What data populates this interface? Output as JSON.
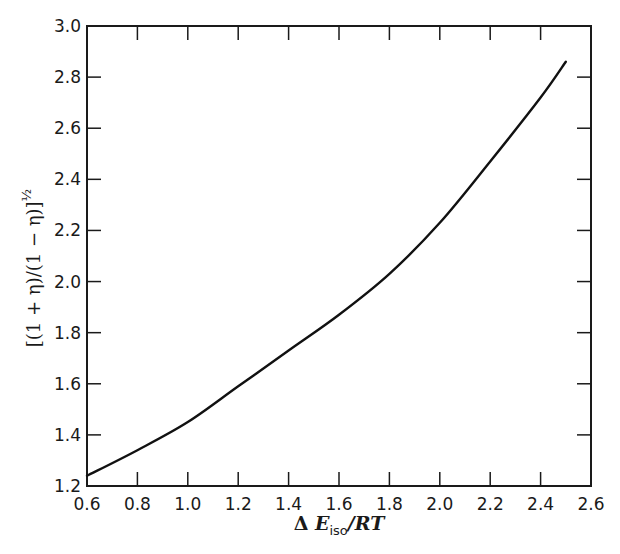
{
  "chart_data": {
    "type": "line",
    "title": "",
    "xlabel": "Δ E_iso/RT",
    "ylabel": "[(1 + η)/(1 − η)]^½",
    "xlim": [
      0.6,
      2.6
    ],
    "ylim": [
      1.2,
      3.0
    ],
    "grid": false,
    "legend": null,
    "x_ticks": [
      "0.6",
      "0.8",
      "1.0",
      "1.2",
      "1.4",
      "1.6",
      "1.8",
      "2.0",
      "2.2",
      "2.4",
      "2.6"
    ],
    "y_ticks": [
      "1.2",
      "1.4",
      "1.6",
      "1.8",
      "2.0",
      "2.2",
      "2.4",
      "2.6",
      "2.8",
      "3.0"
    ],
    "series": [
      {
        "name": "curve",
        "x": [
          0.6,
          0.8,
          1.0,
          1.2,
          1.4,
          1.6,
          1.8,
          2.0,
          2.2,
          2.4,
          2.5
        ],
        "y": [
          1.24,
          1.34,
          1.45,
          1.59,
          1.73,
          1.87,
          2.03,
          2.23,
          2.47,
          2.72,
          2.86
        ]
      }
    ]
  },
  "axes": {
    "x_label_prefix": "Δ ",
    "x_label_var": "E",
    "x_label_sub": "iso",
    "x_label_suffix": "/RT",
    "y_label_main": "[(1 + η)/(1 − η)]",
    "y_label_sup": "½"
  },
  "colors": {
    "line": "#111111",
    "axis": "#1a1a1a",
    "background": "#ffffff"
  }
}
